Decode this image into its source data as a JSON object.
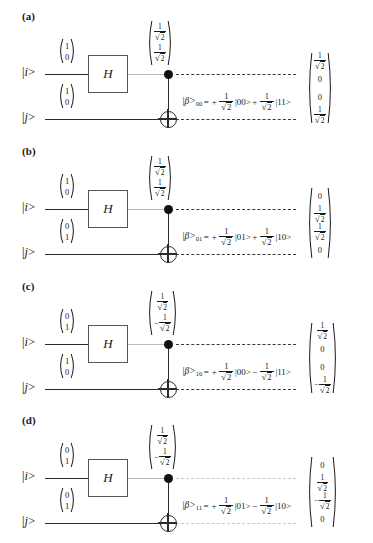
{
  "figure": {
    "type": "quantum-circuit-diagram",
    "wire_labels": {
      "top": "|i>",
      "bottom": "|j>"
    },
    "gate_label": "H",
    "panels": [
      {
        "label": "(a)",
        "input_top": [
          "1",
          "0"
        ],
        "input_bottom": [
          "1",
          "0"
        ],
        "mid_vector": [
          {
            "sign": "",
            "value": "1/√2"
          },
          {
            "sign": "",
            "value": "1/√2"
          }
        ],
        "equation": {
          "state": "|β>",
          "subscript": "00",
          "equals": "=",
          "term1_sign": "+",
          "term1_coeff": "1/√2",
          "term1_ket": "|00>",
          "term2_sign": "+",
          "term2_coeff": "1/√2",
          "term2_ket": "|11>"
        },
        "output_vector": [
          {
            "sign": "",
            "value": "1/√2"
          },
          {
            "sign": "",
            "value": "0"
          },
          {
            "sign": "",
            "value": "0"
          },
          {
            "sign": "",
            "value": "1/√2"
          }
        ]
      },
      {
        "label": "(b)",
        "input_top": [
          "1",
          "0"
        ],
        "input_bottom": [
          "0",
          "1"
        ],
        "mid_vector": [
          {
            "sign": "",
            "value": "1/√2"
          },
          {
            "sign": "",
            "value": "1/√2"
          }
        ],
        "equation": {
          "state": "|β>",
          "subscript": "01",
          "equals": "=",
          "term1_sign": "+",
          "term1_coeff": "1/√2",
          "term1_ket": "|01>",
          "term2_sign": "+",
          "term2_coeff": "1/√2",
          "term2_ket": "|10>"
        },
        "output_vector": [
          {
            "sign": "",
            "value": "0"
          },
          {
            "sign": "",
            "value": "1/√2"
          },
          {
            "sign": "",
            "value": "1/√2"
          },
          {
            "sign": "",
            "value": "0"
          }
        ]
      },
      {
        "label": "(c)",
        "input_top": [
          "0",
          "1"
        ],
        "input_bottom": [
          "1",
          "0"
        ],
        "mid_vector": [
          {
            "sign": "",
            "value": "1/√2"
          },
          {
            "sign": "−",
            "value": "1/√2"
          }
        ],
        "equation": {
          "state": "|β>",
          "subscript": "10",
          "equals": "=",
          "term1_sign": "+",
          "term1_coeff": "1/√2",
          "term1_ket": "|00>",
          "term2_sign": "−",
          "term2_coeff": "1/√2",
          "term2_ket": "|11>"
        },
        "output_vector": [
          {
            "sign": "",
            "value": "1/√2"
          },
          {
            "sign": "",
            "value": "0"
          },
          {
            "sign": "",
            "value": "0"
          },
          {
            "sign": "−",
            "value": "1/√2"
          }
        ]
      },
      {
        "label": "(d)",
        "input_top": [
          "0",
          "1"
        ],
        "input_bottom": [
          "0",
          "1"
        ],
        "mid_vector": [
          {
            "sign": "",
            "value": "1/√2"
          },
          {
            "sign": "−",
            "value": "1/√2"
          }
        ],
        "equation": {
          "state": "|β>",
          "subscript": "11",
          "equals": "=",
          "term1_sign": "+",
          "term1_coeff": "1/√2",
          "term1_ket": "|01>",
          "term2_sign": "−",
          "term2_coeff": "1/√2",
          "term2_ket": "|10>"
        },
        "output_vector": [
          {
            "sign": "",
            "value": "0"
          },
          {
            "sign": "",
            "value": "1/√2"
          },
          {
            "sign": "−",
            "value": "1/√2"
          },
          {
            "sign": "",
            "value": "0"
          }
        ]
      }
    ],
    "colors": {
      "wire": "#2b2b2b",
      "faint_wire": "#b9b9b9",
      "gate_border": "#555555",
      "text": "#1a1a1a"
    }
  }
}
